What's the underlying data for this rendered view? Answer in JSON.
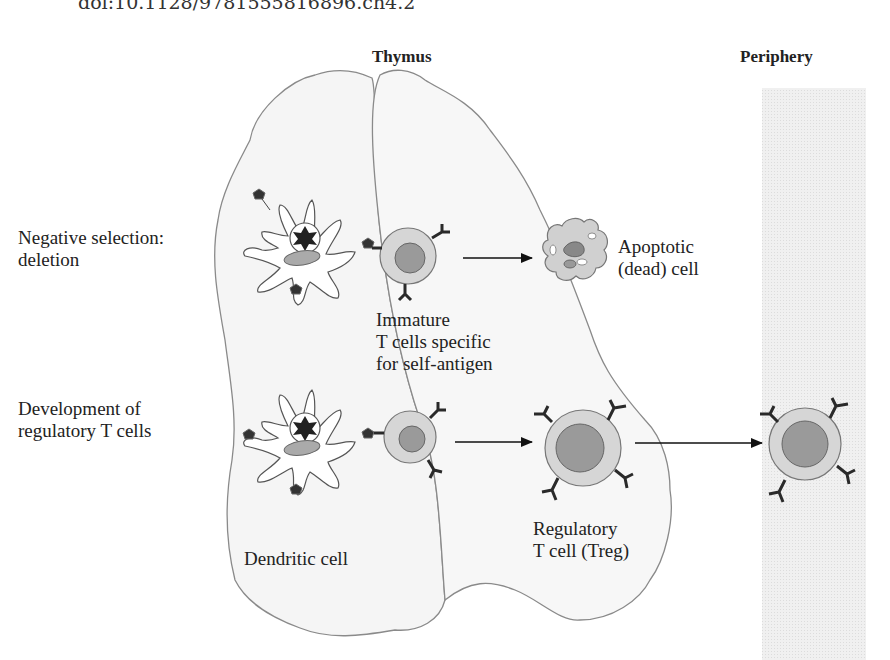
{
  "citation": {
    "text": "doi:10.1128/9781555816896.ch4.2"
  },
  "headers": {
    "thymus": "Thymus",
    "periphery": "Periphery"
  },
  "row_labels": {
    "negative_selection": [
      "Negative selection:",
      "deletion"
    ],
    "treg_development": [
      "Development of",
      "regulatory T cells"
    ]
  },
  "cell_labels": {
    "apoptotic": [
      "Apoptotic",
      "(dead) cell"
    ],
    "immature": [
      "Immature",
      "T cells specific",
      "for self-antigen"
    ],
    "dendritic": "Dendritic cell",
    "treg": [
      "Regulatory",
      "T cell (Treg)"
    ]
  },
  "colors": {
    "thymus_fill": "#f4f4f4",
    "thymus_stroke": "#8a8a8a",
    "periphery_fill": "#ececec",
    "cell_outer": "#d6d6d6",
    "cell_nucleus": "#9a9a9a",
    "receptor": "#2a2a2a",
    "arrow": "#111111"
  }
}
